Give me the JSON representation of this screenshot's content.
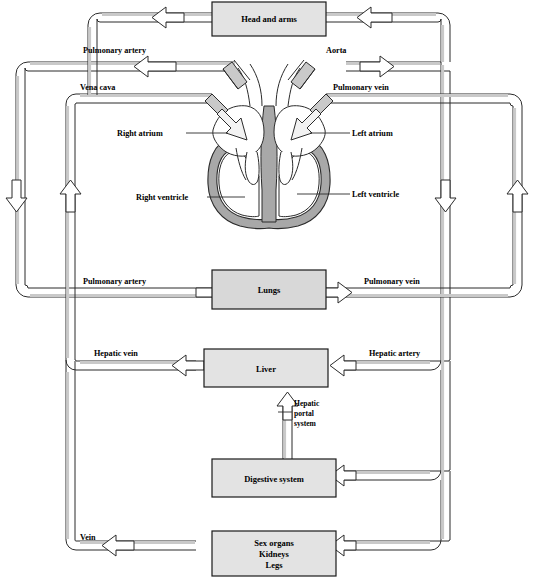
{
  "diagram": {
    "colors": {
      "box_fill": "#e3e3e3",
      "box_stroke": "#1a1a1a",
      "vessel_fill": "#ffffff",
      "vessel_shade": "#c9c9c9",
      "vessel_stroke": "#2b2b2b",
      "heart_muscle": "#a8a8a8",
      "heart_chamber": "#ffffff",
      "background": "#ffffff",
      "text": "#000000"
    }
  },
  "boxes": [
    {
      "id": "head-and-arms",
      "label": "Head and arms"
    },
    {
      "id": "lungs",
      "label": "Lungs"
    },
    {
      "id": "liver",
      "label": "Liver"
    },
    {
      "id": "digestive-system",
      "label": "Digestive system"
    },
    {
      "id": "sex-organs-kidneys-legs",
      "label_line1": "Sex organs",
      "label_line2": "Kidneys",
      "label_line3": "Legs"
    }
  ],
  "vessel_labels": [
    {
      "id": "pulmonary-artery-upper",
      "text": "Pulmonary artery"
    },
    {
      "id": "aorta",
      "text": "Aorta"
    },
    {
      "id": "vena-cava",
      "text": "Vena cava"
    },
    {
      "id": "pulmonary-vein-upper",
      "text": "Pulmonary vein"
    },
    {
      "id": "pulmonary-artery-lower",
      "text": "Pulmonary artery"
    },
    {
      "id": "pulmonary-vein-lower",
      "text": "Pulmonary vein"
    },
    {
      "id": "hepatic-vein",
      "text": "Hepatic vein"
    },
    {
      "id": "hepatic-artery",
      "text": "Hepatic artery"
    },
    {
      "id": "vein",
      "text": "Vein"
    }
  ],
  "hepatic_portal": {
    "line1": "Hepatic",
    "line2": "portal",
    "line3": "system"
  },
  "heart_labels": [
    {
      "id": "right-atrium",
      "text": "Right atrium"
    },
    {
      "id": "left-atrium",
      "text": "Left atrium"
    },
    {
      "id": "right-ventricle",
      "text": "Right ventricle"
    },
    {
      "id": "left-ventricle",
      "text": "Left ventricle"
    }
  ]
}
